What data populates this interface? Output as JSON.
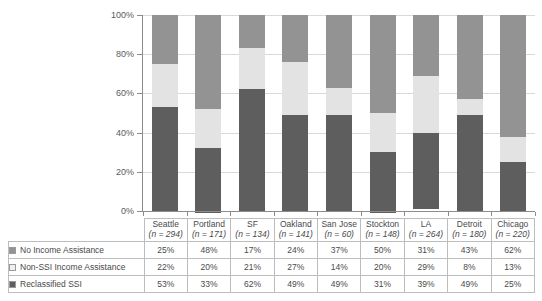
{
  "chart_data": {
    "type": "bar",
    "subtype": "100% stacked column",
    "title": "",
    "xlabel": "",
    "ylabel": "",
    "ylim": [
      0,
      100
    ],
    "yticks": [
      "0%",
      "20%",
      "40%",
      "60%",
      "80%",
      "100%"
    ],
    "ytick_values": [
      0,
      20,
      40,
      60,
      80,
      100
    ],
    "grid": true,
    "legend_position": "table-left",
    "categories": [
      "Seattle",
      "Portland",
      "SF",
      "Oakland",
      "San Jose",
      "Stockton",
      "LA",
      "Detroit",
      "Chicago"
    ],
    "category_sublabels": [
      "(n = 294)",
      "(n = 171)",
      "(n = 134)",
      "(n = 141)",
      "(n = 60)",
      "(n = 148)",
      "(n = 264)",
      "(n = 180)",
      "(n = 220)"
    ],
    "series": [
      {
        "name": "No Income Assistance",
        "color": "#939393",
        "values": [
          25,
          48,
          17,
          24,
          37,
          50,
          31,
          43,
          62
        ],
        "labels": [
          "25%",
          "48%",
          "17%",
          "24%",
          "37%",
          "50%",
          "31%",
          "43%",
          "62%"
        ]
      },
      {
        "name": "Non-SSI Income Assistance",
        "color": "#e3e3e3",
        "values": [
          22,
          20,
          21,
          27,
          14,
          20,
          29,
          8,
          13
        ],
        "labels": [
          "22%",
          "20%",
          "21%",
          "27%",
          "14%",
          "20%",
          "29%",
          "8%",
          "13%"
        ]
      },
      {
        "name": "Reclassified SSI",
        "color": "#5e5e5e",
        "values": [
          53,
          33,
          62,
          49,
          49,
          31,
          39,
          49,
          25
        ],
        "labels": [
          "53%",
          "33%",
          "62%",
          "49%",
          "49%",
          "31%",
          "39%",
          "49%",
          "25%"
        ]
      }
    ]
  }
}
